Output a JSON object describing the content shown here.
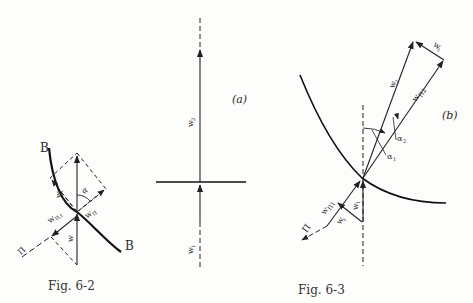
{
  "figures": [
    {
      "id": "fig-6-2",
      "caption": "Fig. 6-2",
      "labels": {
        "curve_top": "B",
        "curve_bottom": "B",
        "w": "w",
        "w_t": "w",
        "w_t_sub": "t",
        "w_parallel": "w",
        "w_parallel_sub": "Π",
        "w_parallel_d": "w",
        "w_parallel_d_sub": "Π,t",
        "alpha": "α",
        "pi": "Π"
      }
    },
    {
      "id": "fig-6-3a",
      "panel": "(a)",
      "labels": {
        "w2": "w",
        "w2_sub": "2",
        "w1": "w",
        "w1_sub": "1"
      }
    },
    {
      "id": "fig-6-3b",
      "caption": "Fig. 6-3",
      "panel": "(b)",
      "labels": {
        "w2": "w",
        "w2_sub": "2",
        "wt": "w",
        "wt_sub": "t",
        "w_par2": "w",
        "w_par2_sub": "Π2",
        "alpha1": "α",
        "alpha1_sub": "1",
        "alpha2": "α",
        "alpha2_sub": "2",
        "w_par1": "w",
        "w_par1_sub": "Π1",
        "w1": "w",
        "w1_sub": "1",
        "wt_low": "w",
        "wt_low_sub": "t",
        "pi": "Π"
      }
    }
  ],
  "colors": {
    "ink": "#222222",
    "paper": "#fdfdfb"
  }
}
